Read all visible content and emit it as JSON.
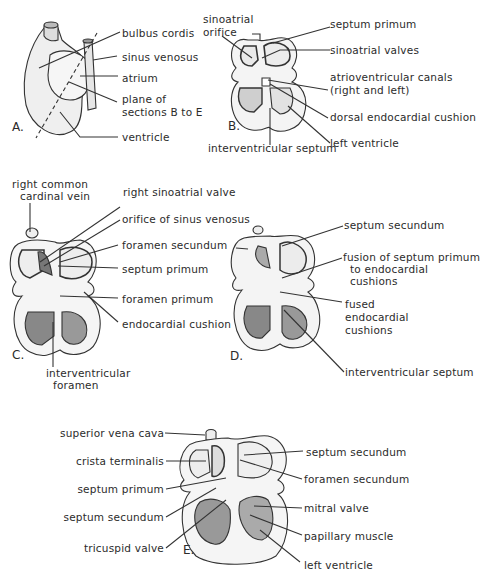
{
  "figure": {
    "panels": [
      {
        "id": "A",
        "letter": "A.",
        "labels": [
          "bulbus cordis",
          "sinus venosus",
          "atrium",
          "plane of",
          "sections B to E",
          "ventricle"
        ]
      },
      {
        "id": "B",
        "letter": "B.",
        "labels": [
          "sinoatrial",
          "orifice",
          "septum primum",
          "sinoatrial valves",
          "atrioventricular canals",
          "(right and left)",
          "dorsal endocardial cushion",
          "left ventricle",
          "interventricular septum"
        ]
      },
      {
        "id": "C",
        "letter": "C.",
        "labels": [
          "right common",
          "cardinal vein",
          "right sinoatrial valve",
          "orifice of sinus venosus",
          "foramen secundum",
          "septum primum",
          "foramen primum",
          "endocardial cushion",
          "interventricular",
          "foramen"
        ]
      },
      {
        "id": "D",
        "letter": "D.",
        "labels": [
          "septum secundum",
          "fusion of septum primum",
          "to endocardial",
          "cushions",
          "fused",
          "endocardial",
          "cushions",
          "interventricular septum"
        ]
      },
      {
        "id": "E",
        "letter": "E.",
        "labels": [
          "superior vena cava",
          "crista terminalis",
          "septum primum",
          "septum secundum",
          "tricuspid valve",
          "septum secundum",
          "foramen secundum",
          "mitral valve",
          "papillary muscle",
          "left ventricle"
        ]
      }
    ]
  }
}
